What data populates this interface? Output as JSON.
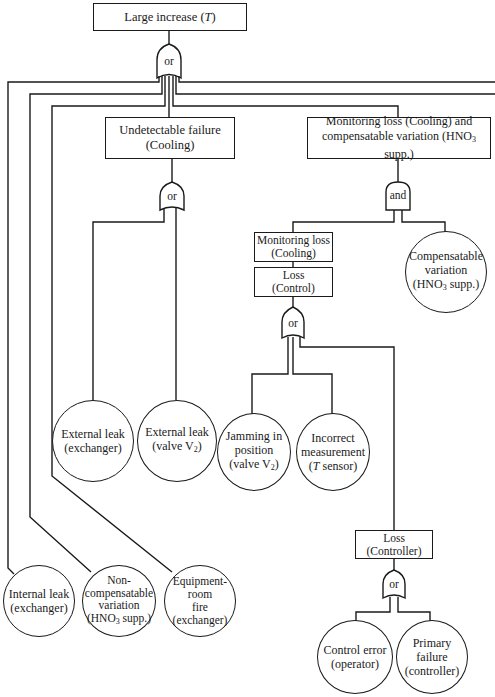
{
  "diagram": {
    "type": "fault-tree",
    "top_event": {
      "label": "Large increase (T)"
    },
    "gates": {
      "top": "or",
      "undetectable": "or",
      "monitoring_and": "and",
      "loss_control": "or",
      "loss_controller": "or"
    },
    "intermediate_events": {
      "undetectable_failure": {
        "line1": "Undetectable failure",
        "line2": "(Cooling)"
      },
      "monitoring_and_comp": {
        "line1": "Monitoring loss (Cooling) and",
        "line2": "compensatable variation (HNO₃ supp.)"
      },
      "monitoring_loss": {
        "line1": "Monitoring loss",
        "line2": "(Cooling)"
      },
      "loss_control": {
        "line1": "Loss",
        "line2": "(Control)"
      },
      "loss_controller": {
        "line1": "Loss",
        "line2": "(Controller)"
      }
    },
    "basic_events": {
      "external_leak_exchanger": {
        "line1": "External leak",
        "line2": "(exchanger)"
      },
      "external_leak_valve": {
        "line1": "External leak",
        "line2": "(valve V₂)"
      },
      "jamming": {
        "line1": "Jamming in",
        "line2": "position",
        "line3": "(valve V₂)"
      },
      "incorrect_measurement": {
        "line1": "Incorrect",
        "line2": "measurement",
        "line3": "(T sensor)"
      },
      "compensatable_variation": {
        "line1": "Compensatable",
        "line2": "variation",
        "line3": "(HNO₃ supp.)"
      },
      "internal_leak": {
        "line1": "Internal leak",
        "line2": "(exchanger)"
      },
      "non_compensatable": {
        "line1": "Non-",
        "line2": "compensatable",
        "line3": "variation",
        "line4": "(HNO₃ supp.)"
      },
      "equipment_fire": {
        "line1": "Equipment-",
        "line2": "room",
        "line3": "fire (exchanger)"
      },
      "control_error": {
        "line1": "Control error",
        "line2": "(operator)"
      },
      "primary_failure": {
        "line1": "Primary",
        "line2": "failure",
        "line3": "(controller)"
      }
    }
  }
}
